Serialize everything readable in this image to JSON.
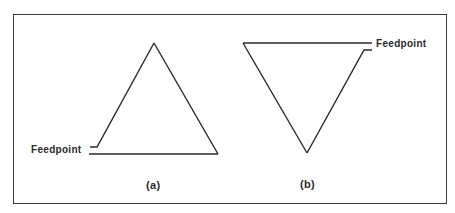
{
  "diagram": {
    "panels": [
      {
        "id": "a",
        "caption": "(a)",
        "shape": "triangle-apex-up",
        "feedpoint_label": "Feedpoint",
        "feedpoint_location": "bottom-left corner"
      },
      {
        "id": "b",
        "caption": "(b)",
        "shape": "triangle-apex-down",
        "feedpoint_label": "Feedpoint",
        "feedpoint_location": "top-right corner"
      }
    ],
    "colors": {
      "line": "#2a2a2a",
      "frame": "#3a3a3a",
      "background": "#ffffff"
    }
  }
}
